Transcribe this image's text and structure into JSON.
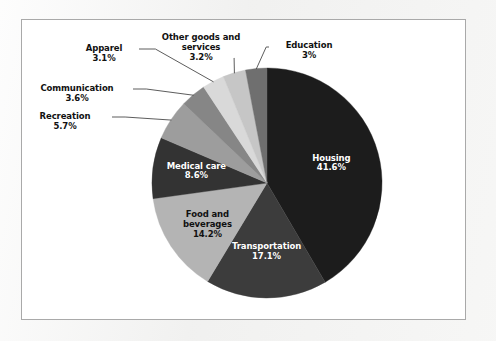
{
  "chart_data": {
    "type": "pie",
    "title": "",
    "subtitle": "",
    "xlabel": "",
    "ylabel": "",
    "legend_position": "none",
    "grid": false,
    "start_angle_deg": 0,
    "direction": "clockwise",
    "categories": [
      "Housing",
      "Transportation",
      "Food and beverages",
      "Medical care",
      "Recreation",
      "Communication",
      "Apparel",
      "Other goods and services",
      "Education"
    ],
    "values": [
      41.6,
      17.1,
      14.2,
      8.6,
      5.7,
      3.6,
      3.1,
      3.2,
      3.0
    ],
    "value_labels": [
      "41.6%",
      "17.1%",
      "14.2%",
      "8.6%",
      "5.7%",
      "3.6%",
      "3.1%",
      "3.2%",
      "3%"
    ],
    "units": "percent",
    "slices": [
      {
        "name": "Housing",
        "label": "Housing",
        "value": 41.6,
        "value_label": "41.6%",
        "color": "#1c1c1c",
        "label_placement": "inside",
        "label_color": "#ffffff",
        "text": "Housing\n41.6%"
      },
      {
        "name": "Transportation",
        "label": "Transportation",
        "value": 17.1,
        "value_label": "17.1%",
        "color": "#3c3c3c",
        "label_placement": "inside",
        "label_color": "#ffffff",
        "text": "Transportation\n17.1%"
      },
      {
        "name": "Food and beverages",
        "label": "Food and beverages",
        "value": 14.2,
        "value_label": "14.2%",
        "color": "#b4b4b4",
        "label_placement": "inside",
        "label_color": "#111111",
        "text": "Food and\nbeverages\n14.2%"
      },
      {
        "name": "Medical care",
        "label": "Medical care",
        "value": 8.6,
        "value_label": "8.6%",
        "color": "#333333",
        "label_placement": "inside",
        "label_color": "#ffffff",
        "text": "Medical care\n8.6%"
      },
      {
        "name": "Recreation",
        "label": "Recreation",
        "value": 5.7,
        "value_label": "5.7%",
        "color": "#9d9d9d",
        "label_placement": "outside",
        "label_color": "#111111",
        "text": "Recreation\n5.7%"
      },
      {
        "name": "Communication",
        "label": "Communication",
        "value": 3.6,
        "value_label": "3.6%",
        "color": "#868686",
        "label_placement": "outside",
        "label_color": "#111111",
        "text": "Communication\n3.6%"
      },
      {
        "name": "Apparel",
        "label": "Apparel",
        "value": 3.1,
        "value_label": "3.1%",
        "color": "#d9d9d9",
        "label_placement": "outside",
        "label_color": "#111111",
        "text": "Apparel\n3.1%"
      },
      {
        "name": "Other goods and services",
        "label": "Other goods and services",
        "value": 3.2,
        "value_label": "3.2%",
        "color": "#c6c6c6",
        "label_placement": "outside",
        "label_color": "#111111",
        "text": "Other goods and\nservices\n3.2%"
      },
      {
        "name": "Education",
        "label": "Education",
        "value": 3.0,
        "value_label": "3%",
        "color": "#6f6f6f",
        "label_placement": "outside",
        "label_color": "#111111",
        "text": "Education\n3%"
      }
    ]
  },
  "figure": {
    "border_color": "#a9a9a9",
    "plot_background": "#ffffff",
    "page_background": "#f2f2f1",
    "center": {
      "x": 267,
      "y": 183
    },
    "radius": 115
  }
}
